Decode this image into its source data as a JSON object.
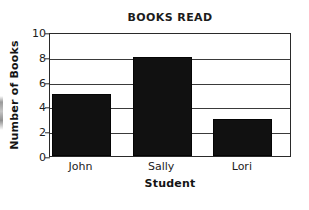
{
  "chart_data": {
    "type": "bar",
    "title": "BOOKS READ",
    "xlabel": "Student",
    "ylabel": "Number of Books",
    "categories": [
      "John",
      "Sally",
      "Lori"
    ],
    "values": [
      5,
      8,
      3
    ],
    "series": [
      {
        "name": "Number of Books",
        "values": [
          5,
          8,
          3
        ]
      }
    ],
    "ylim": [
      0,
      10
    ],
    "yticks": [
      0,
      2,
      4,
      6,
      8,
      10
    ],
    "ytick_labels": [
      "0",
      "2",
      "4",
      "6",
      "8",
      "10"
    ],
    "grid": "horizontal",
    "legend": "none",
    "bar_color": "#111111",
    "frame_color": "#2a2a2a",
    "background": "#ffffff"
  },
  "axes": {
    "y_tick_0": "0",
    "y_tick_1": "2",
    "y_tick_2": "4",
    "y_tick_3": "6",
    "y_tick_4": "8",
    "y_tick_5": "10"
  },
  "categories_labels": {
    "c0": "John",
    "c1": "Sally",
    "c2": "Lori"
  }
}
